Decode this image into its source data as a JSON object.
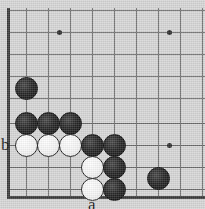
{
  "diagram": {
    "kind": "go-board-corner-diagram",
    "width": 205,
    "height": 209,
    "board_color": "#d6d6d6",
    "grid_color": "#6a6a6a",
    "border_color": "#3a3a3a",
    "grid_spacing": 22,
    "origin": {
      "x": 26,
      "y": 32
    },
    "columns": 9,
    "rows": 8,
    "borders": {
      "left": {
        "x": 7,
        "y1": 12,
        "y2": 198
      },
      "bottom": {
        "y": 196,
        "x1": 7,
        "x2": 205
      }
    },
    "grid_lines": {
      "horizontal_y": [
        10,
        32,
        54,
        76,
        98,
        123,
        145,
        167,
        189
      ],
      "vertical_x": [
        26,
        48,
        70,
        92,
        114,
        136,
        158,
        180,
        202
      ]
    },
    "star_points": [
      {
        "name": "hoshi-upper-left",
        "x": 59,
        "y": 32
      },
      {
        "name": "hoshi-upper-right",
        "x": 169,
        "y": 32
      },
      {
        "name": "hoshi-lower-right",
        "x": 169,
        "y": 145
      }
    ],
    "stones": [
      {
        "id": "black-1",
        "color": "black",
        "x": 26,
        "y": 88
      },
      {
        "id": "black-2",
        "color": "black",
        "x": 26,
        "y": 123
      },
      {
        "id": "black-3",
        "color": "black",
        "x": 48,
        "y": 123
      },
      {
        "id": "black-4",
        "color": "black",
        "x": 70,
        "y": 123
      },
      {
        "id": "white-1",
        "color": "white",
        "x": 26,
        "y": 145
      },
      {
        "id": "white-2",
        "color": "white",
        "x": 48,
        "y": 145
      },
      {
        "id": "white-3",
        "color": "white",
        "x": 70,
        "y": 145
      },
      {
        "id": "black-5",
        "color": "black",
        "x": 92,
        "y": 145
      },
      {
        "id": "black-6",
        "color": "black",
        "x": 114,
        "y": 145
      },
      {
        "id": "white-4",
        "color": "white",
        "x": 92,
        "y": 167
      },
      {
        "id": "black-7",
        "color": "black",
        "x": 114,
        "y": 167
      },
      {
        "id": "white-5",
        "color": "white",
        "x": 92,
        "y": 189
      },
      {
        "id": "black-8",
        "color": "black",
        "x": 114,
        "y": 189
      },
      {
        "id": "black-9",
        "color": "black",
        "x": 158,
        "y": 178
      }
    ],
    "labels": [
      {
        "id": "label-a",
        "text": "a",
        "x": 88,
        "y": 196,
        "points_to": "below white stone at column 4, bottom row"
      },
      {
        "id": "label-b",
        "text": "b",
        "x": 1,
        "y": 136,
        "points_to": "left of white stone row"
      }
    ]
  }
}
